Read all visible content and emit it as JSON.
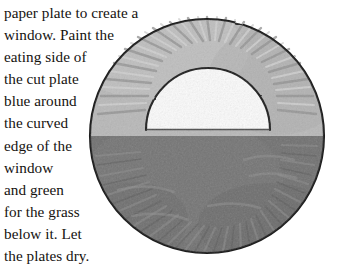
{
  "page": {
    "background_color": "#ffffff",
    "width": 340,
    "height": 269
  },
  "instructions": {
    "name": "paper-plate-window-craft-instructions",
    "lines": [
      "paper plate to create a",
      "window. Paint the",
      "eating side of",
      "the cut plate",
      "blue around",
      "the curved",
      "edge of the",
      "window",
      "and green",
      "for the grass",
      "below it. Let",
      "the plates dry."
    ],
    "full_text": "paper plate to create a window. Paint the eating side of the cut plate blue around the curved edge of the window and green for the grass below it. Let the plates dry.",
    "text_color": "#15120f"
  },
  "illustration": {
    "name": "paper-plate-with-semicircular-window",
    "description": "Grayscale drawing of a round paper plate viewed face on. The upper portion of the plate is painted a light tone representing blue sky and the lower portion a darker tone representing green grass. A semicircular window has been cut out of the upper middle, showing white through the opening. Radial scalloped fluting runs around the plate rim.",
    "colors": {
      "sky_fill": "#b9b9b9",
      "grass_fill": "#6f6f6f",
      "window_fill": "#fdfdfd",
      "outline": "#1d1d1d",
      "rim_ridge_light": "#cfcfcf",
      "rim_ridge_dark": "#9a9a9a",
      "grass_texture_light": "#848484",
      "grass_texture_dark": "#5c5c5c"
    },
    "geometry": {
      "plate_center_x": 119,
      "plate_center_y": 126,
      "plate_radius": 117,
      "horizon_y": 118,
      "window_center_x": 120,
      "window_base_y": 118,
      "window_radius": 62
    },
    "regions": [
      {
        "name": "sky-region",
        "label": "blue painted area above the horizon"
      },
      {
        "name": "grass-region",
        "label": "green painted area below the horizon"
      },
      {
        "name": "window-cutout",
        "label": "semicircular window opening"
      },
      {
        "name": "plate-rim",
        "label": "scalloped outer rim of the paper plate"
      }
    ]
  }
}
